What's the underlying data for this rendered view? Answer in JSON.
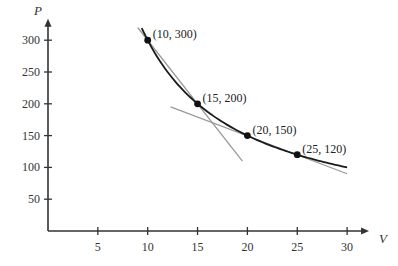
{
  "chart_data": {
    "type": "line",
    "title": "",
    "xlabel": "V",
    "ylabel": "P",
    "xlim": [
      0,
      31
    ],
    "ylim": [
      0,
      315
    ],
    "x_ticks": [
      5,
      10,
      15,
      20,
      25,
      30
    ],
    "y_ticks": [
      50,
      100,
      150,
      200,
      250,
      300
    ],
    "grid": false,
    "legend": "none",
    "curve": {
      "name": "P = 3000/V",
      "x_range": [
        9.4,
        30
      ]
    },
    "points": [
      {
        "x": 10,
        "y": 300,
        "label": "(10, 300)"
      },
      {
        "x": 15,
        "y": 200,
        "label": "(15, 200)"
      },
      {
        "x": 20,
        "y": 150,
        "label": "(20, 150)"
      },
      {
        "x": 25,
        "y": 120,
        "label": "(25, 120)"
      }
    ],
    "secant_lines": [
      {
        "name": "secant-10-15",
        "from": [
          9,
          320
        ],
        "to": [
          19.5,
          110
        ]
      },
      {
        "name": "secant-20-25",
        "from": [
          12.3,
          195
        ],
        "to": [
          30,
          90
        ]
      }
    ],
    "colors": {
      "axis": "#333333",
      "curve": "#1a1a1a",
      "secant": "#9a9a9a",
      "point": "#111111"
    }
  }
}
